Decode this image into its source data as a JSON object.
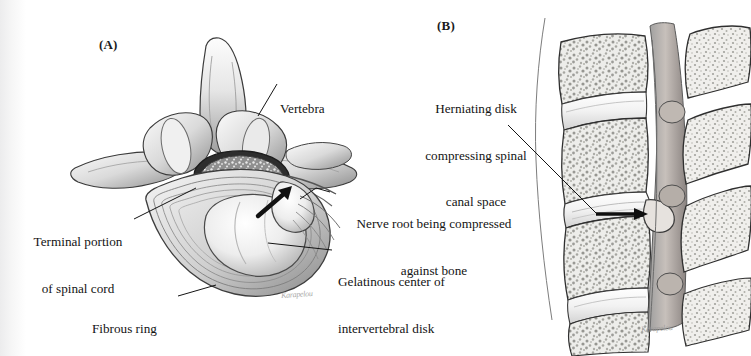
{
  "figure": {
    "width": 751,
    "height": 356,
    "background_color": "#ffffff",
    "ink_color": "#131313"
  },
  "panels": [
    {
      "id": "A",
      "letter": "(A)",
      "view": "superior transverse view of lumbar vertebra with herniated disk",
      "signature": "Karapelou"
    },
    {
      "id": "B",
      "letter": "(B)",
      "view": "sagittal section of lumbar spine showing disk herniation into spinal canal",
      "signature": "Karapelou"
    }
  ],
  "labels": {
    "vertebra": {
      "lines": [
        "Vertebra"
      ],
      "panel": "A"
    },
    "terminal_portion": {
      "lines": [
        "Terminal portion",
        "of spinal cord"
      ],
      "panel": "A"
    },
    "fibrous_ring": {
      "lines": [
        "Fibrous ring"
      ],
      "panel": "A"
    },
    "nerve_root": {
      "lines": [
        "Nerve root being compressed",
        "against bone"
      ],
      "panel": "A"
    },
    "gelatinous_center": {
      "lines": [
        "Gelatinous center of",
        "intervertebral disk"
      ],
      "panel": "A"
    },
    "herniating_disk": {
      "lines": [
        "Herniating disk",
        "compressing spinal",
        "canal space"
      ],
      "panel": "B"
    }
  },
  "annotations": {
    "arrow_panel_a": {
      "name": "herniation-direction-arrow",
      "description": "bold arrow pointing up-right at the herniation in panel A"
    },
    "arrow_panel_b": {
      "name": "herniation-pointer-arrow",
      "description": "bold horizontal arrow pointing right at the herniated disk in panel B"
    }
  }
}
